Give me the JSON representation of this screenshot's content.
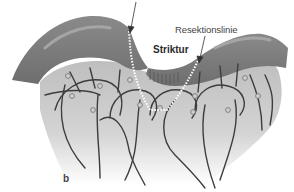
{
  "figure": {
    "panel_label": "b",
    "labels": {
      "resection_line": "Resektionslinie",
      "stricture": "Striktur"
    },
    "colors": {
      "bowel_wall": "#7b7b7b",
      "bowel_highlight": "#9a9a9a",
      "mesentery": "#c9c9c9",
      "vessels": "#3d3d3d",
      "resection_dots": "#ffffff",
      "background": "#ffffff"
    }
  }
}
